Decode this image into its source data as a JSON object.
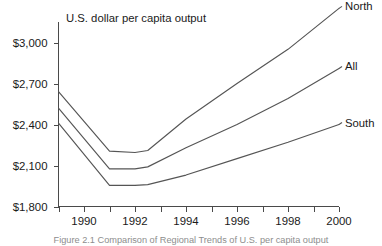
{
  "chart_data": {
    "type": "line",
    "title": "U.S. dollar per capita output",
    "xlabel": "",
    "ylabel": "",
    "xlim": [
      1989,
      2000
    ],
    "ylim": [
      1800,
      3150
    ],
    "grid": false,
    "legend_position": "right-end-labels",
    "y_ticks": [
      1800,
      2100,
      2400,
      2700,
      3000
    ],
    "y_tick_labels": [
      "$1,800",
      "$2,100",
      "$2,400",
      "$2,700",
      "$3,000"
    ],
    "x_ticks": [
      1990,
      1992,
      1994,
      1996,
      1998,
      2000
    ],
    "x_tick_labels": [
      "1990",
      "1992",
      "1994",
      "1996",
      "1998",
      "2000"
    ],
    "x_minor_ticks": [
      1989,
      1991,
      1993,
      1995,
      1997,
      1999
    ],
    "x": [
      1989,
      1991,
      1992,
      1992.5,
      1994,
      1996,
      1998,
      2000
    ],
    "series": [
      {
        "name": "North",
        "label": "North",
        "values": [
          2640,
          2205,
          2195,
          2210,
          2440,
          2700,
          2950,
          3250
        ]
      },
      {
        "name": "All",
        "label": "All",
        "values": [
          2520,
          2075,
          2075,
          2090,
          2230,
          2400,
          2590,
          2810
        ]
      },
      {
        "name": "South",
        "label": "South",
        "values": [
          2410,
          1955,
          1955,
          1960,
          2030,
          2150,
          2270,
          2400
        ]
      }
    ]
  },
  "caption": "Figure 2.1  Comparison of Regional Trends of U.S. per capita output"
}
